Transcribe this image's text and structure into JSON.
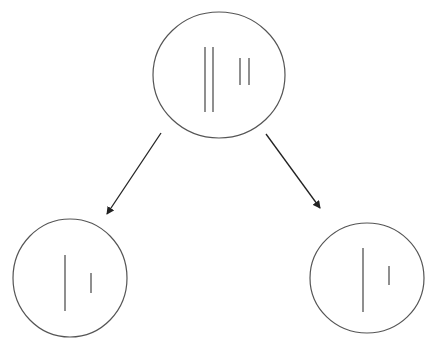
{
  "diagram": {
    "stroke_color": "#555555",
    "line_color": "#333333",
    "arrow_color": "#222222",
    "background": "#ffffff",
    "nodes": [
      {
        "id": "parent",
        "label": "",
        "ellipse": {
          "cx": 219,
          "cy": 75,
          "rx": 66,
          "ry": 63
        },
        "lines": [
          {
            "x": 205,
            "y1": 47,
            "y2": 112
          },
          {
            "x": 213,
            "y1": 47,
            "y2": 112
          },
          {
            "x": 240,
            "y1": 58,
            "y2": 85
          },
          {
            "x": 249,
            "y1": 58,
            "y2": 85
          }
        ]
      },
      {
        "id": "child-left",
        "label": "",
        "ellipse": {
          "cx": 70,
          "cy": 278,
          "rx": 57,
          "ry": 59
        },
        "lines": [
          {
            "x": 65,
            "y1": 255,
            "y2": 311
          },
          {
            "x": 91,
            "y1": 273,
            "y2": 293
          }
        ]
      },
      {
        "id": "child-right",
        "label": "",
        "ellipse": {
          "cx": 367,
          "cy": 278,
          "rx": 57,
          "ry": 55
        },
        "lines": [
          {
            "x": 363,
            "y1": 248,
            "y2": 312
          },
          {
            "x": 389,
            "y1": 266,
            "y2": 285
          }
        ]
      }
    ],
    "edges": [
      {
        "from": "parent",
        "to": "child-left",
        "x1": 161,
        "y1": 133,
        "x2": 107,
        "y2": 214
      },
      {
        "from": "parent",
        "to": "child-right",
        "x1": 266,
        "y1": 134,
        "x2": 320,
        "y2": 208
      }
    ]
  }
}
